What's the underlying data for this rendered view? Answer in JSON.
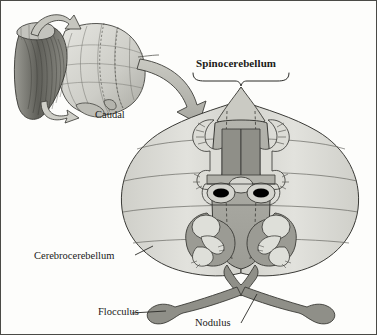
{
  "figure": {
    "type": "anatomical-diagram",
    "view": "dorsal (unfolded) view of cerebellum with somatotopic homunculi"
  },
  "labels": {
    "spinocerebellum": "Spinocerebellum",
    "cerebrocerebellum": "Cerebrocerebellum",
    "flocculus": "Flocculus",
    "nodulus": "Nodulus",
    "caudal": "Caudal"
  },
  "colors": {
    "page_background": "#fdfdfb",
    "border": "#4a4a46",
    "outline": "#3a3a36",
    "cerebrocerebellum_fill": "#d9d9d4",
    "cerebrocerebellum_fill_light": "#e4e4df",
    "spinocerebellum_fill": "#b6b6b0",
    "spinocerebellum_dark": "#9a9a93",
    "vermis_fill": "#a8a8a1",
    "flocculonodular_fill": "#8f8f88",
    "homunculus_fill": "#ddddd7",
    "eye_fill": "#000000",
    "arrow_fill": "#b9b9b2",
    "inset_fill": "#cfcfc9",
    "inset_dark": "#6e6e68",
    "text": "#1a1a18"
  },
  "regions": [
    {
      "name": "spinocerebellum",
      "description": "midline vermis and paravermal zone containing two somatotopic homunculi, darker gray"
    },
    {
      "name": "cerebrocerebellum",
      "description": "large lateral hemispheres, light gray with curved folia contour lines"
    },
    {
      "name": "flocculonodular-lobe",
      "description": "dark gray bar at bottom with bulbous flocculus at each end and nodulus at midline"
    }
  ],
  "annotations": {
    "brace": "curly brace under Spinocerebellum label spanning the midline region",
    "rotation_arrow": "large curved arrow from inset brainstem view to main unfolded view",
    "caudal_arrow": "curved arrow in inset indicating caudal direction",
    "midline_dashed": "dashed lines marking the vermis midline boundaries"
  },
  "inset": {
    "description": "three-dimensional view of brainstem and cerebellum showing rotation to the unfolded view",
    "position": "top-left"
  }
}
